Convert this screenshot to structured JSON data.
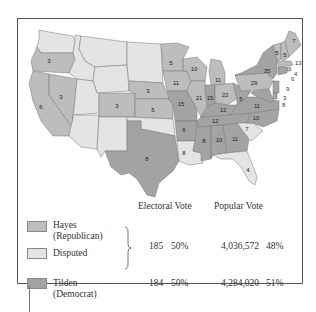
{
  "colors": {
    "hayes_republican": "#bdbdbd",
    "disputed": "#e4e4e4",
    "tilden_democrat": "#a3a3a3",
    "frame": "#555555"
  },
  "map": {
    "states": [
      {
        "name": "Oregon",
        "party": "republican",
        "electoral_votes": "3"
      },
      {
        "name": "California",
        "party": "republican",
        "electoral_votes": "6"
      },
      {
        "name": "Nevada",
        "party": "republican",
        "electoral_votes": "3"
      },
      {
        "name": "Colorado",
        "party": "republican",
        "electoral_votes": "3"
      },
      {
        "name": "Nebraska",
        "party": "republican",
        "electoral_votes": "3"
      },
      {
        "name": "Kansas",
        "party": "republican",
        "electoral_votes": "5"
      },
      {
        "name": "Texas",
        "party": "democrat",
        "electoral_votes": "8"
      },
      {
        "name": "Minnesota",
        "party": "republican",
        "electoral_votes": "5"
      },
      {
        "name": "Iowa",
        "party": "republican",
        "electoral_votes": "11"
      },
      {
        "name": "Missouri",
        "party": "democrat",
        "electoral_votes": "15"
      },
      {
        "name": "Arkansas",
        "party": "democrat",
        "electoral_votes": "6"
      },
      {
        "name": "Louisiana",
        "party": "disputed",
        "electoral_votes": "8"
      },
      {
        "name": "Wisconsin",
        "party": "republican",
        "electoral_votes": "10"
      },
      {
        "name": "Illinois",
        "party": "republican",
        "electoral_votes": "21"
      },
      {
        "name": "Michigan",
        "party": "republican",
        "electoral_votes": "11"
      },
      {
        "name": "Indiana",
        "party": "democrat",
        "electoral_votes": "15"
      },
      {
        "name": "Ohio",
        "party": "republican",
        "electoral_votes": "22"
      },
      {
        "name": "Kentucky",
        "party": "democrat",
        "electoral_votes": "12"
      },
      {
        "name": "Tennessee",
        "party": "democrat",
        "electoral_votes": "12"
      },
      {
        "name": "Mississippi",
        "party": "democrat",
        "electoral_votes": "8"
      },
      {
        "name": "Alabama",
        "party": "democrat",
        "electoral_votes": "10"
      },
      {
        "name": "Georgia",
        "party": "democrat",
        "electoral_votes": "11"
      },
      {
        "name": "Florida",
        "party": "disputed",
        "electoral_votes": "4"
      },
      {
        "name": "South Carolina",
        "party": "disputed",
        "electoral_votes": "7"
      },
      {
        "name": "North Carolina",
        "party": "democrat",
        "electoral_votes": "10"
      },
      {
        "name": "Virginia",
        "party": "democrat",
        "electoral_votes": "11"
      },
      {
        "name": "West Virginia",
        "party": "democrat",
        "electoral_votes": "5"
      },
      {
        "name": "Pennsylvania",
        "party": "republican",
        "electoral_votes": "29"
      },
      {
        "name": "New York",
        "party": "democrat",
        "electoral_votes": "35"
      },
      {
        "name": "Vermont",
        "party": "republican",
        "electoral_votes": "5"
      },
      {
        "name": "New Hampshire",
        "party": "republican",
        "electoral_votes": "5"
      },
      {
        "name": "Maine",
        "party": "republican",
        "electoral_votes": "7"
      },
      {
        "name": "Massachusetts",
        "party": "republican",
        "electoral_votes": "13"
      },
      {
        "name": "Rhode Island",
        "party": "republican",
        "electoral_votes": "4"
      },
      {
        "name": "Connecticut",
        "party": "democrat",
        "electoral_votes": "6"
      },
      {
        "name": "New Jersey",
        "party": "democrat",
        "electoral_votes": "9"
      },
      {
        "name": "Delaware",
        "party": "democrat",
        "electoral_votes": "3"
      },
      {
        "name": "Maryland",
        "party": "democrat",
        "electoral_votes": "8"
      }
    ]
  },
  "legend": {
    "headers": {
      "electoral": "Electoral Vote",
      "popular": "Popular Vote"
    },
    "items": [
      {
        "line1": "Hayes",
        "line2": "(Republican)"
      },
      {
        "line1": "Disputed",
        "line2": ""
      },
      {
        "line1": "Tilden",
        "line2": "(Democrat)"
      }
    ],
    "rows": [
      {
        "candidate": "Hayes",
        "electoral_votes": "185",
        "electoral_pct": "50%",
        "popular_votes": "4,036,572",
        "popular_pct": "48%"
      },
      {
        "candidate": "Tilden",
        "electoral_votes": "184",
        "electoral_pct": "50%",
        "popular_votes": "4,284,020",
        "popular_pct": "51%"
      }
    ]
  }
}
